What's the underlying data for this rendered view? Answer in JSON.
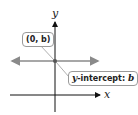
{
  "diagram": {
    "axes": {
      "x_label": "x",
      "y_label": "y"
    },
    "line": {
      "description": "horizontal line y = b",
      "color": "#8a8a8a"
    },
    "point": {
      "coords": "(0, b)"
    },
    "callouts": {
      "point_label": "(0, b)",
      "intercept_prefix": "y",
      "intercept_text": "-intercept: ",
      "intercept_value": "b"
    }
  }
}
